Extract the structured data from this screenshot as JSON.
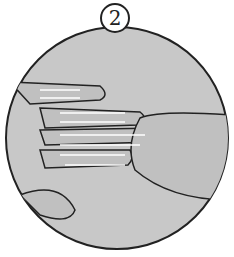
{
  "illustration": {
    "step_number": "2",
    "subject": "hands with finger stretching arrows",
    "colors": {
      "fill": "#c8c8c8",
      "outline": "#222222",
      "arrows": "#ffffff",
      "background": "#ffffff"
    }
  }
}
